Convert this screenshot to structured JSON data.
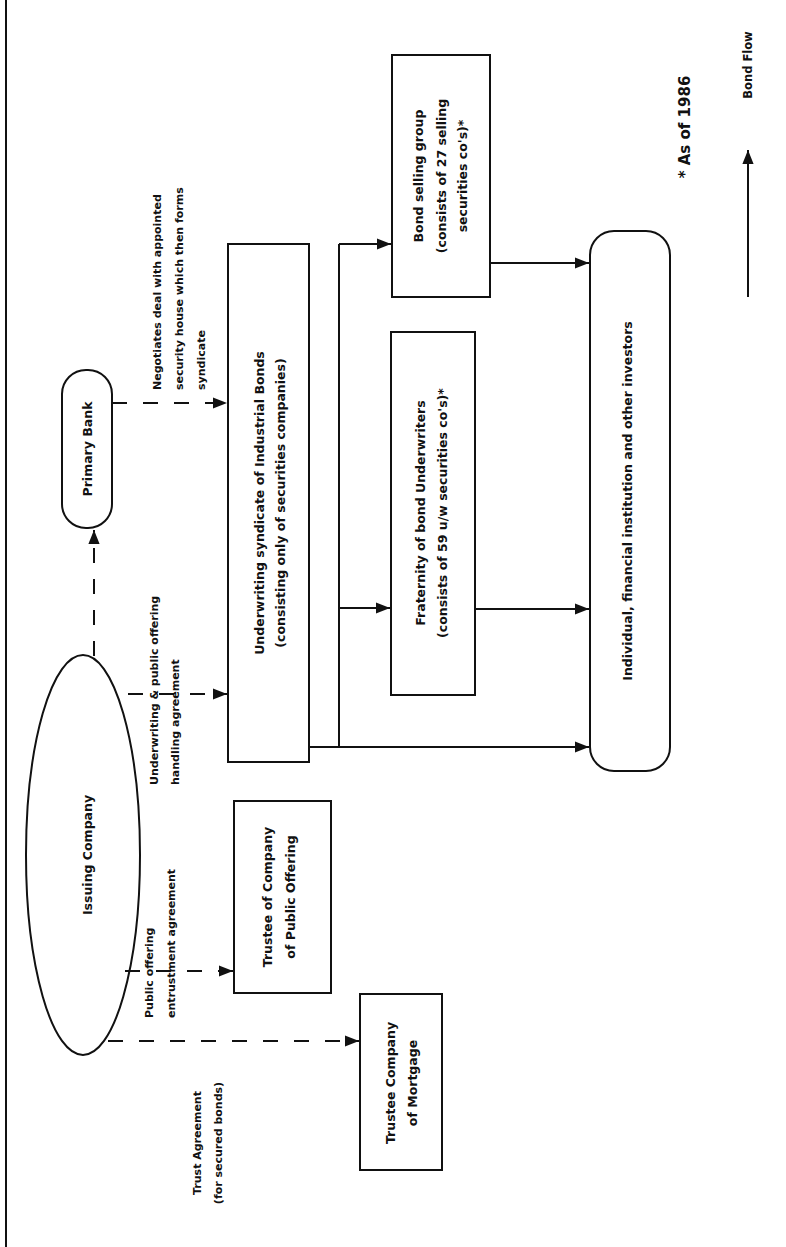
{
  "diagram": {
    "orientation": "rotated-90-ccw",
    "nodes": {
      "issuing_company": {
        "label": "Issuing Company"
      },
      "primary_bank": {
        "label": "Primary Bank"
      },
      "underwriting_syndicate": {
        "line1": "Underwriting syndicate of Industrial Bonds",
        "line2": "(consisting only of securities companies)"
      },
      "fraternity": {
        "line1": "Fraternity of bond Underwriters",
        "line2": "(consists of 59 u/w securities co's)*"
      },
      "bond_selling_group": {
        "line1": "Bond selling group",
        "line2": "(consists of 27 selling",
        "line3": "securities co's)*"
      },
      "investors": {
        "label": "Individual, financial institution and other investors"
      },
      "trustee_public_offering": {
        "line1": "Trustee of Company",
        "line2": "of Public Offering"
      },
      "trustee_mortgage": {
        "line1": "Trustee Company",
        "line2": "of Mortgage"
      }
    },
    "edges": {
      "negotiates": {
        "line1": "Negotiates deal with appointed",
        "line2": "security house which then forms",
        "line3": "syndicate"
      },
      "underwriting_agreement": {
        "line1": "Underwriting & public offering",
        "line2": "handling agreement"
      },
      "public_offering_entrustment": {
        "line1": "Public offering",
        "line2": "entrustment agreement"
      },
      "trust_agreement": {
        "line1": "Trust Agreement",
        "line2": "(for secured bonds)"
      }
    },
    "footnote": "* As of 1986",
    "legend": {
      "label": "Bond Flow"
    }
  }
}
